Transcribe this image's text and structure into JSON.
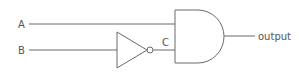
{
  "diagram": {
    "type": "logic-circuit",
    "inputs": [
      {
        "name": "A",
        "label": "A"
      },
      {
        "name": "B",
        "label": "B"
      }
    ],
    "intermediate": {
      "name": "C",
      "label": "C"
    },
    "output": {
      "name": "output",
      "label": "output"
    },
    "gates": [
      {
        "type": "NOT",
        "input": "B",
        "output": "C"
      },
      {
        "type": "AND",
        "inputs": [
          "A",
          "C"
        ],
        "output": "output"
      }
    ],
    "colors": {
      "line": "#6a6a6a",
      "text": "#555555",
      "background": "#ffffff"
    }
  }
}
